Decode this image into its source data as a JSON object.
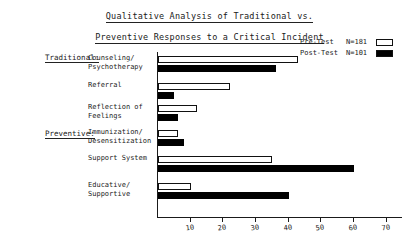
{
  "title": {
    "line1": "Qualitative Analysis of Traditional vs.",
    "line2": "Preventive Responses to a Critical Incident"
  },
  "legend": {
    "pre": {
      "label": "Pre-Test",
      "n": "N=181",
      "swatch": "open-square-icon",
      "color": "#ffffff"
    },
    "post": {
      "label": "Post-Test",
      "n": "N=101",
      "swatch": "filled-square-icon",
      "color": "#000000"
    }
  },
  "groups": [
    {
      "name": "Traditional:"
    },
    {
      "name": "Preventive:"
    }
  ],
  "axis": {
    "ticks": [
      10,
      20,
      30,
      40,
      50,
      60,
      70
    ],
    "tick_labels": [
      "10",
      "20",
      "30",
      "40",
      "50",
      "60",
      "70"
    ],
    "max": 75
  },
  "chart_data": {
    "type": "bar",
    "orientation": "horizontal",
    "title": "Qualitative Analysis of Traditional vs. Preventive Responses to a Critical Incident",
    "xlabel": "",
    "ylabel": "",
    "xlim": [
      0,
      75
    ],
    "grid": false,
    "legend_position": "top-right",
    "categories": [
      "Counseling/ Psychotherapy",
      "Referral",
      "Reflection of Feelings",
      "Immunization/ Desensitization",
      "Support System",
      "Educative/ Supportive"
    ],
    "category_lines": [
      [
        "Counseling/",
        "Psychotherapy"
      ],
      [
        "Referral",
        ""
      ],
      [
        "Reflection of",
        "Feelings"
      ],
      [
        "Immunization/",
        "Desensitization"
      ],
      [
        "Support System",
        ""
      ],
      [
        "Educative/",
        "Supportive"
      ]
    ],
    "category_groups": [
      "Traditional:",
      "Traditional:",
      "Traditional:",
      "Preventive:",
      "Preventive:",
      "Preventive:"
    ],
    "series": [
      {
        "name": "Pre-Test",
        "n": 181,
        "color": "#ffffff",
        "values": [
          43,
          22,
          12,
          6,
          35,
          10
        ]
      },
      {
        "name": "Post-Test",
        "n": 101,
        "color": "#000000",
        "values": [
          36,
          5,
          6,
          8,
          60,
          40
        ]
      }
    ]
  }
}
